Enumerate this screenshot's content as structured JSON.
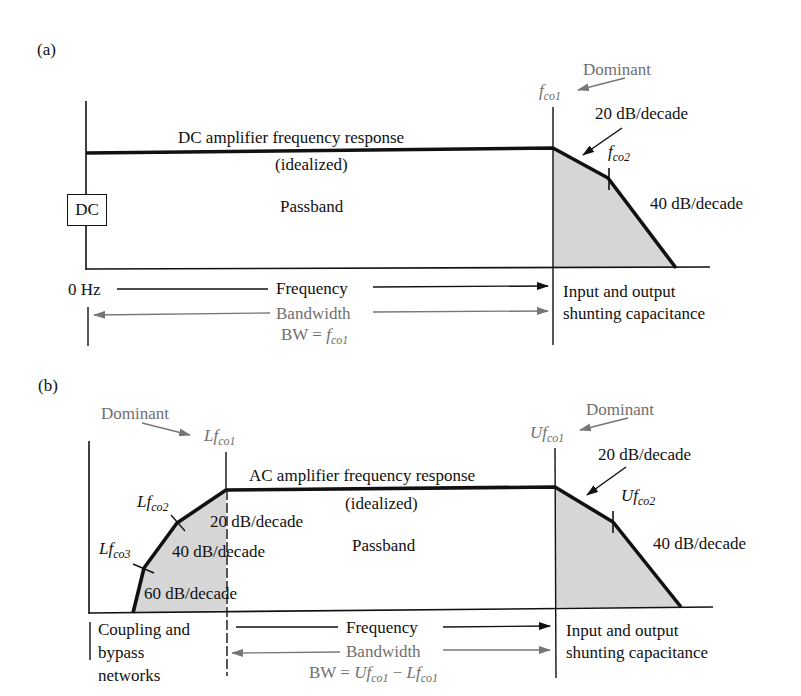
{
  "panel_a": {
    "label": "(a)",
    "title": "DC amplifier frequency response",
    "idealized": "(idealized)",
    "passband": "Passband",
    "dc_box": "DC",
    "dominant": "Dominant",
    "fco1": {
      "main": "f",
      "sub": "co1"
    },
    "fco2": {
      "main": "f",
      "sub": "co2"
    },
    "slope1": "20 dB/decade",
    "slope2": "40 dB/decade",
    "zero_hz": "0 Hz",
    "frequency": "Frequency",
    "bandwidth": "Bandwidth",
    "bw_eq_prefix": "BW = ",
    "bw_eq": {
      "main": "f",
      "sub": "co1"
    },
    "right_note_line1": "Input and output",
    "right_note_line2": "shunting capacitance"
  },
  "panel_b": {
    "label": "(b)",
    "title": "AC amplifier frequency response",
    "idealized": "(idealized)",
    "passband": "Passband",
    "dominant_left": "Dominant",
    "dominant_right": "Dominant",
    "lfco1": {
      "main": "Lf",
      "sub": "co1"
    },
    "lfco2": {
      "main": "Lf",
      "sub": "co2"
    },
    "lfco3": {
      "main": "Lf",
      "sub": "co3"
    },
    "ufco1": {
      "main": "Uf",
      "sub": "co1"
    },
    "ufco2": {
      "main": "Uf",
      "sub": "co2"
    },
    "left_slope1": "20 dB/decade",
    "left_slope2": "40 dB/decade",
    "left_slope3": "60 dB/decade",
    "right_slope1": "20 dB/decade",
    "right_slope2": "40 dB/decade",
    "frequency": "Frequency",
    "bandwidth": "Bandwidth",
    "bw_eq_prefix": "BW = ",
    "bw_eq_u": {
      "main": "Uf",
      "sub": "co1"
    },
    "bw_eq_minus": " − ",
    "bw_eq_l": {
      "main": "Lf",
      "sub": "co1"
    },
    "left_note_line1": "Coupling and",
    "left_note_line2": "bypass",
    "left_note_line3": "networks",
    "right_note_line1": "Input and output",
    "right_note_line2": "shunting capacitance"
  },
  "colors": {
    "ink": "#111111",
    "annotation_gray": "#6f6f6f",
    "shade": "#d6d6d6"
  }
}
